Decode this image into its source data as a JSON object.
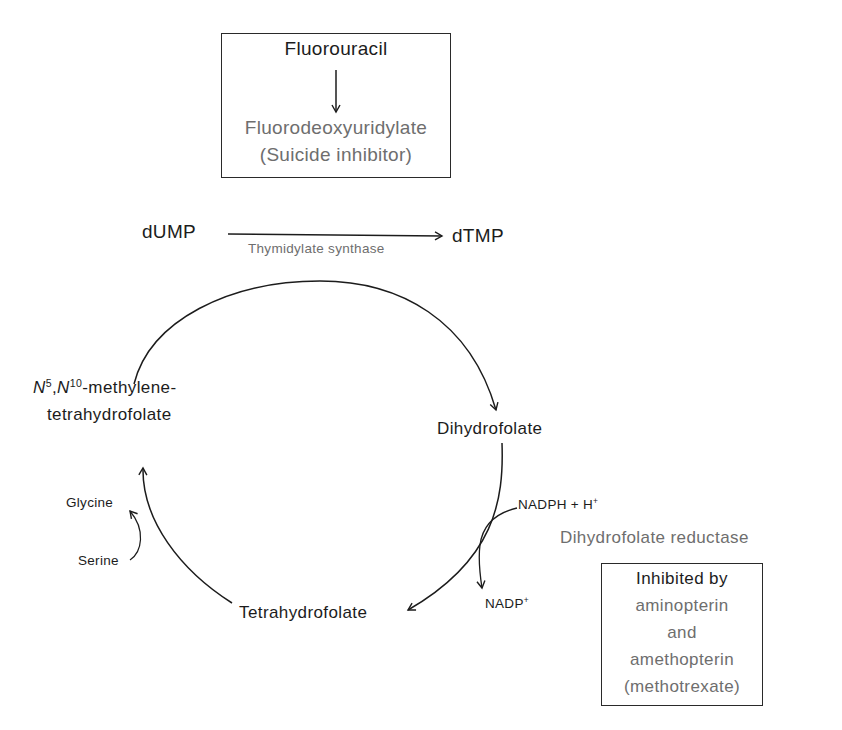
{
  "inhibitor_box": {
    "drug": "Fluorouracil",
    "product": "Fluorodeoxyuridylate",
    "note": "(Suicide inhibitor)"
  },
  "top_reaction": {
    "substrate": "dUMP",
    "product": "dTMP",
    "enzyme": "Thymidylate synthase"
  },
  "cycle": {
    "methylene_thf": {
      "n5": "N",
      "n5_sup": "5",
      "sep": ",",
      "n10": "N",
      "n10_sup": "10",
      "suffix": "-methylene-",
      "line2": "tetrahydrofolate"
    },
    "dihydrofolate": "Dihydrofolate",
    "tetrahydrofolate": "Tetrahydrofolate",
    "serine": "Serine",
    "glycine": "Glycine",
    "nadph": "NADPH + H",
    "nadph_sup": "+",
    "nadp": "NADP",
    "nadp_sup": "+",
    "reductase": "Dihydrofolate reductase"
  },
  "reductase_box": {
    "title": "Inhibited by",
    "line1": "aminopterin",
    "line2": "and",
    "line3": "amethopterin",
    "line4": "(methotrexate)"
  },
  "colors": {
    "ink": "#1c1c1c",
    "gray_text": "#6e6e6e",
    "background": "#ffffff"
  }
}
